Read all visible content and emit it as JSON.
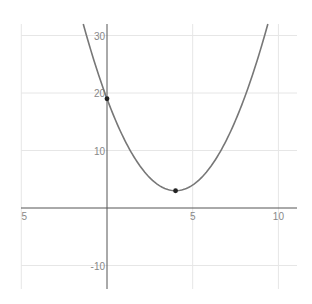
{
  "chart_data": {
    "type": "line",
    "title": "",
    "function": "y = (x - 4)^2 + 3",
    "xlabel": "",
    "ylabel": "",
    "xlim": [
      -5,
      11
    ],
    "ylim": [
      -14,
      32
    ],
    "grid": true,
    "x_ticks": [
      -5,
      5,
      10
    ],
    "x_tick_labels": [
      "5",
      "5",
      "10"
    ],
    "y_ticks": [
      -10,
      10,
      20,
      30
    ],
    "y_tick_labels": [
      "-10",
      "10",
      "20",
      "30"
    ],
    "series": [
      {
        "name": "parabola",
        "color": "#777777",
        "x": [
          -1.385,
          -1,
          0,
          1,
          2,
          3,
          4,
          5,
          6,
          7,
          8,
          9,
          9.385
        ],
        "values": [
          32,
          28,
          19,
          12,
          7,
          4,
          3,
          4,
          7,
          12,
          19,
          28,
          32
        ]
      }
    ],
    "points": [
      {
        "label": "y-intercept",
        "x": 0,
        "y": 19,
        "color": "#222222"
      },
      {
        "label": "vertex",
        "x": 4,
        "y": 3,
        "color": "#222222"
      }
    ]
  },
  "colors": {
    "grid": "#e6e6e6",
    "axis": "#555555",
    "curve": "#777777",
    "point": "#222222",
    "tick_text": "#888888"
  }
}
